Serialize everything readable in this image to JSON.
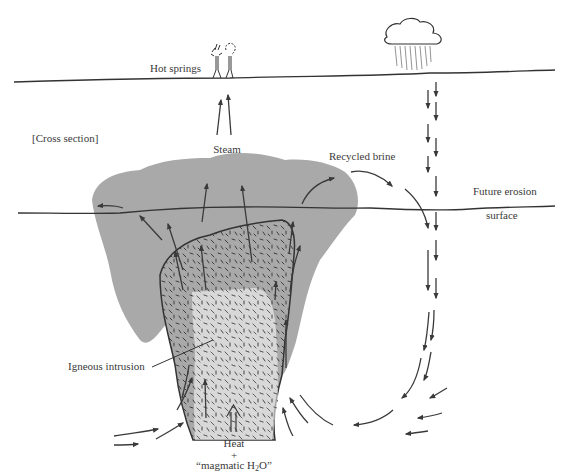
{
  "diagram": {
    "colors": {
      "ink": "#3a3a3a",
      "altered_zone": "#a9a9a9",
      "background": "#ffffff",
      "dash_texture": "#555555"
    },
    "labels": {
      "hot_springs": "Hot springs",
      "cross_section": "[Cross section]",
      "steam": "Steam",
      "recycled_brine": "Recycled brine",
      "future_erosion_line1": "Future erosion",
      "future_erosion_line2": "surface",
      "igneous_intrusion": "Igneous intrusion",
      "heat": "Heat",
      "plus": "+",
      "magmatic_water_prefix": "“magmatic H",
      "magmatic_water_sub": "2",
      "magmatic_water_suffix": "O”"
    },
    "icons": {
      "cloud": "rain-cloud-icon",
      "hot_spring": "geyser-icon",
      "arrow": "flow-arrow-icon"
    },
    "features": [
      {
        "name": "ground-surface",
        "description": "Land surface line"
      },
      {
        "name": "future-erosion-surface",
        "description": "Line crossing the altered zone"
      },
      {
        "name": "altered-zone",
        "description": "Gray hydrothermally altered envelope"
      },
      {
        "name": "intrusion-border-zone",
        "description": "Stippled outer intrusion zone"
      },
      {
        "name": "intrusion-core",
        "description": "White stippled igneous intrusion core"
      },
      {
        "name": "meteoric-downflow",
        "description": "Descending rainwater arrows"
      },
      {
        "name": "convection-cells",
        "description": "Upflow arrows around the intrusion"
      }
    ]
  }
}
